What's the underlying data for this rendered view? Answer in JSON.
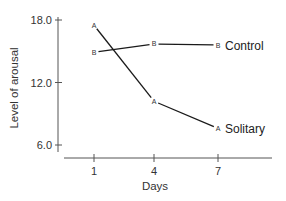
{
  "chart_data": {
    "type": "line",
    "title": "",
    "xlabel": "Days",
    "ylabel": "Level of arousal",
    "x": [
      1,
      4,
      7
    ],
    "x_tick_labels": [
      "1",
      "4",
      "7"
    ],
    "y_tick_labels": [
      "18.0",
      "12.0",
      "6.0"
    ],
    "y_ticks": [
      18.0,
      12.0,
      6.0
    ],
    "ylim": [
      6.0,
      18.0
    ],
    "grid": false,
    "legend": "inline labels at line ends",
    "series": [
      {
        "name": "Control",
        "marker": "B",
        "values": [
          14.9,
          15.7,
          15.6
        ]
      },
      {
        "name": "Solitary",
        "marker": "A",
        "values": [
          17.5,
          10.2,
          7.6
        ]
      }
    ]
  },
  "colors": {
    "line": "#1a1a1a",
    "axis": "#555555",
    "text": "#333333"
  }
}
